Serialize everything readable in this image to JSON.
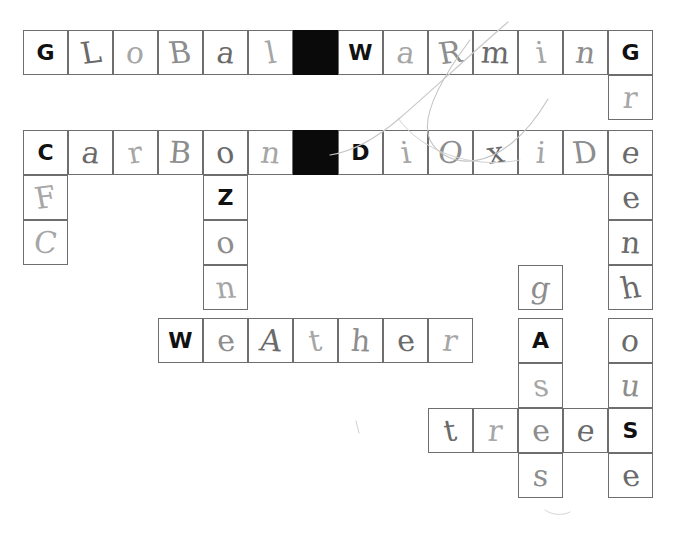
{
  "sheet": {
    "title": "Climate change crossword worksheet",
    "description": "Hand-completed crossword grid on white paper",
    "background_color": "#ffffff",
    "grid_line_color": "#6e6e6e",
    "block_color": "#0a0a0a",
    "printed_letter_color": "#111111",
    "handwritten_letter_color": "#8d8d8d"
  },
  "grid": {
    "columns": 14,
    "rows": 11,
    "cell_size": 45,
    "origin_x": 23,
    "origin_y": 30
  },
  "answers": [
    {
      "clue_word": "GLOBAL",
      "direction": "across",
      "row": 1,
      "col": 1,
      "text": "GLOBAL"
    },
    {
      "clue_word": "WARMING",
      "direction": "across",
      "row": 1,
      "col": 8,
      "text": "WARMING"
    },
    {
      "clue_word": "CARBON",
      "direction": "across",
      "row": 2,
      "col": 1,
      "text": "CARBON"
    },
    {
      "clue_word": "DIOXIDE",
      "direction": "across",
      "row": 2,
      "col": 8,
      "text": "DIOXIDE"
    },
    {
      "clue_word": "WEATHER",
      "direction": "across",
      "row": 6,
      "col": 4,
      "text": "WEATHER"
    },
    {
      "clue_word": "TREES",
      "direction": "across",
      "row": 9,
      "col": 10,
      "text": "TREES"
    },
    {
      "clue_word": "CFC",
      "direction": "down",
      "row": 2,
      "col": 1,
      "text": "CFC"
    },
    {
      "clue_word": "OZONE",
      "direction": "down",
      "row": 2,
      "col": 5,
      "text": "OZONE"
    },
    {
      "clue_word": "GREENHOUSE",
      "direction": "down",
      "row": 1,
      "col": 14,
      "text": "GREENHOUSE"
    },
    {
      "clue_word": "GASES",
      "direction": "down",
      "row": 6,
      "col": 12,
      "text": "GASES"
    }
  ],
  "blocks": [
    {
      "row": 1,
      "col": 7
    },
    {
      "row": 2,
      "col": 7
    }
  ],
  "cells": [
    {
      "row": 1,
      "col": 1,
      "letter": "G",
      "style": "print"
    },
    {
      "row": 1,
      "col": 2,
      "letter": "L",
      "style": "hand"
    },
    {
      "row": 1,
      "col": 3,
      "letter": "o",
      "style": "hand"
    },
    {
      "row": 1,
      "col": 4,
      "letter": "B",
      "style": "hand"
    },
    {
      "row": 1,
      "col": 5,
      "letter": "a",
      "style": "hand"
    },
    {
      "row": 1,
      "col": 6,
      "letter": "l",
      "style": "hand"
    },
    {
      "row": 1,
      "col": 7,
      "letter": "",
      "style": "block"
    },
    {
      "row": 1,
      "col": 8,
      "letter": "W",
      "style": "print"
    },
    {
      "row": 1,
      "col": 9,
      "letter": "a",
      "style": "hand"
    },
    {
      "row": 1,
      "col": 10,
      "letter": "R",
      "style": "hand"
    },
    {
      "row": 1,
      "col": 11,
      "letter": "m",
      "style": "hand"
    },
    {
      "row": 1,
      "col": 12,
      "letter": "i",
      "style": "hand"
    },
    {
      "row": 1,
      "col": 13,
      "letter": "n",
      "style": "hand"
    },
    {
      "row": 1,
      "col": 14,
      "letter": "G",
      "style": "print"
    },
    {
      "row": 2,
      "col": 14,
      "letter": "r",
      "style": "hand"
    },
    {
      "row": 3,
      "col": 1,
      "letter": "C",
      "style": "print"
    },
    {
      "row": 3,
      "col": 2,
      "letter": "a",
      "style": "hand"
    },
    {
      "row": 3,
      "col": 3,
      "letter": "r",
      "style": "hand"
    },
    {
      "row": 3,
      "col": 4,
      "letter": "B",
      "style": "hand"
    },
    {
      "row": 3,
      "col": 5,
      "letter": "o",
      "style": "hand"
    },
    {
      "row": 3,
      "col": 6,
      "letter": "n",
      "style": "hand"
    },
    {
      "row": 3,
      "col": 7,
      "letter": "",
      "style": "block"
    },
    {
      "row": 3,
      "col": 8,
      "letter": "D",
      "style": "print"
    },
    {
      "row": 3,
      "col": 9,
      "letter": "i",
      "style": "hand"
    },
    {
      "row": 3,
      "col": 10,
      "letter": "O",
      "style": "hand"
    },
    {
      "row": 3,
      "col": 11,
      "letter": "x",
      "style": "hand"
    },
    {
      "row": 3,
      "col": 12,
      "letter": "i",
      "style": "hand"
    },
    {
      "row": 3,
      "col": 13,
      "letter": "D",
      "style": "hand"
    },
    {
      "row": 3,
      "col": 14,
      "letter": "e",
      "style": "hand"
    },
    {
      "row": 4,
      "col": 1,
      "letter": "F",
      "style": "hand"
    },
    {
      "row": 4,
      "col": 5,
      "letter": "Z",
      "style": "print"
    },
    {
      "row": 4,
      "col": 14,
      "letter": "e",
      "style": "hand"
    },
    {
      "row": 5,
      "col": 1,
      "letter": "C",
      "style": "hand"
    },
    {
      "row": 5,
      "col": 5,
      "letter": "o",
      "style": "hand"
    },
    {
      "row": 5,
      "col": 14,
      "letter": "n",
      "style": "hand"
    },
    {
      "row": 6,
      "col": 5,
      "letter": "n",
      "style": "hand"
    },
    {
      "row": 6,
      "col": 12,
      "letter": "g",
      "style": "hand"
    },
    {
      "row": 6,
      "col": 14,
      "letter": "h",
      "style": "hand"
    },
    {
      "row": 7,
      "col": 4,
      "letter": "W",
      "style": "print"
    },
    {
      "row": 7,
      "col": 5,
      "letter": "e",
      "style": "hand"
    },
    {
      "row": 7,
      "col": 6,
      "letter": "A",
      "style": "hand"
    },
    {
      "row": 7,
      "col": 7,
      "letter": "t",
      "style": "hand"
    },
    {
      "row": 7,
      "col": 8,
      "letter": "h",
      "style": "hand"
    },
    {
      "row": 7,
      "col": 9,
      "letter": "e",
      "style": "hand"
    },
    {
      "row": 7,
      "col": 10,
      "letter": "r",
      "style": "hand"
    },
    {
      "row": 7,
      "col": 12,
      "letter": "A",
      "style": "print"
    },
    {
      "row": 7,
      "col": 14,
      "letter": "o",
      "style": "hand"
    },
    {
      "row": 8,
      "col": 12,
      "letter": "s",
      "style": "hand"
    },
    {
      "row": 8,
      "col": 14,
      "letter": "u",
      "style": "hand"
    },
    {
      "row": 9,
      "col": 10,
      "letter": "t",
      "style": "hand"
    },
    {
      "row": 9,
      "col": 11,
      "letter": "r",
      "style": "hand"
    },
    {
      "row": 9,
      "col": 12,
      "letter": "e",
      "style": "hand"
    },
    {
      "row": 9,
      "col": 13,
      "letter": "e",
      "style": "hand"
    },
    {
      "row": 9,
      "col": 14,
      "letter": "S",
      "style": "print"
    },
    {
      "row": 10,
      "col": 12,
      "letter": "s",
      "style": "hand"
    },
    {
      "row": 10,
      "col": 14,
      "letter": "e",
      "style": "hand"
    }
  ],
  "layout_rows": [
    {
      "row": 1,
      "top": 30
    },
    {
      "row": 2,
      "top": 75
    },
    {
      "row": 3,
      "top": 130
    },
    {
      "row": 4,
      "top": 175
    },
    {
      "row": 5,
      "top": 220
    },
    {
      "row": 6,
      "top": 265
    },
    {
      "row": 7,
      "top": 318
    },
    {
      "row": 8,
      "top": 363
    },
    {
      "row": 9,
      "top": 408
    },
    {
      "row": 10,
      "top": 453
    },
    {
      "row": 11,
      "top": 498
    }
  ]
}
